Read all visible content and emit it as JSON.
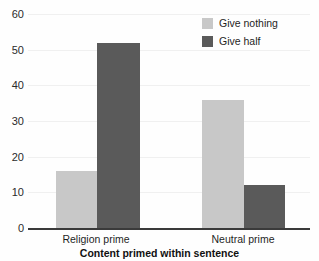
{
  "chart_data": {
    "type": "bar",
    "title": "",
    "subtitle": "",
    "xlabel": "Content primed within sentence",
    "ylabel": "",
    "categories": [
      "Religion prime",
      "Neutral prime"
    ],
    "series": [
      {
        "name": "Give nothing",
        "values": [
          16,
          36
        ],
        "color": "#c8c8c8"
      },
      {
        "name": "Give half",
        "values": [
          52,
          12
        ],
        "color": "#5a5a5a"
      }
    ],
    "ylim": [
      0,
      60
    ],
    "yticks": [
      0,
      10,
      20,
      30,
      40,
      50,
      60
    ],
    "ytick_labels": [
      "0",
      "10",
      "20",
      "30",
      "40",
      "50",
      "60"
    ],
    "grid": true,
    "grid_axis": "y",
    "legend_position": "top-right",
    "bar_group_gap": true
  },
  "axes": {
    "x_title": "Content primed within sentence",
    "tick_labels_y": [
      "60",
      "50",
      "40",
      "30",
      "20",
      "10",
      "0"
    ],
    "category_labels": [
      "Religion prime",
      "Neutral prime"
    ]
  },
  "legend": {
    "entries": [
      {
        "label": "Give nothing",
        "swatch": "light-gray-swatch"
      },
      {
        "label": "Give half",
        "swatch": "dark-gray-swatch"
      }
    ]
  },
  "colors": {
    "series_light": "#c8c8c8",
    "series_dark": "#5a5a5a",
    "axis": "#3a3a3a",
    "grid": "#f0f0f0",
    "text": "#1f1f1f",
    "background": "#fefefe"
  }
}
